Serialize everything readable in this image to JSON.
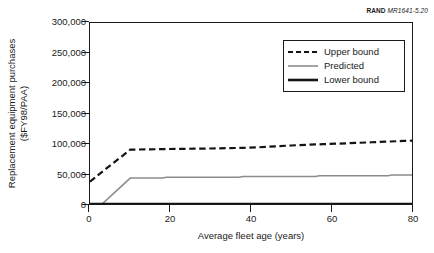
{
  "figure_id": {
    "organization": "RAND",
    "number": "MR1641-5.20"
  },
  "chart_data": {
    "type": "line",
    "title": "",
    "xlabel": "Average fleet age (years)",
    "ylabel": "Replacement equipment purchases ($FY98/PAA)",
    "ylabel_line1": "Replacement equipment purchases",
    "ylabel_line2": "($FY98/PAA)",
    "xlim": [
      0,
      80
    ],
    "ylim": [
      0,
      300000
    ],
    "xticks": [
      0,
      20,
      40,
      60,
      80
    ],
    "xtick_labels": [
      "0",
      "20",
      "40",
      "60",
      "80"
    ],
    "yticks": [
      0,
      50000,
      100000,
      150000,
      200000,
      250000,
      300000
    ],
    "ytick_labels": [
      "0",
      "50,000",
      "100,000",
      "150,000",
      "200,000",
      "250,000",
      "300,000"
    ],
    "grid": false,
    "legend_position": "upper right",
    "series": [
      {
        "name": "Upper bound",
        "style": "dashed",
        "color": "#141414",
        "width": 2.2,
        "x": [
          0,
          2,
          4,
          6,
          8,
          10,
          14,
          18,
          22,
          26,
          30,
          34,
          38,
          42,
          46,
          50,
          54,
          58,
          62,
          66,
          70,
          74,
          78,
          80
        ],
        "y": [
          37000,
          48000,
          58500,
          69000,
          79500,
          90000,
          90500,
          91000,
          91300,
          91700,
          92000,
          92500,
          93000,
          94000,
          95500,
          97000,
          98200,
          99200,
          100200,
          101200,
          102300,
          103400,
          104600,
          105000
        ]
      },
      {
        "name": "Predicted",
        "style": "solid",
        "color": "#8c8c8c",
        "width": 1.6,
        "x": [
          0,
          3,
          10,
          18,
          19,
          37,
          38,
          56,
          57,
          74,
          75,
          80
        ],
        "y": [
          0,
          0,
          43000,
          43000,
          44300,
          44300,
          45500,
          45500,
          46800,
          46800,
          48000,
          48000
        ]
      },
      {
        "name": "Lower bound",
        "style": "solid",
        "color": "#141414",
        "width": 2.6,
        "x": [
          0,
          80
        ],
        "y": [
          0,
          0
        ]
      }
    ]
  }
}
